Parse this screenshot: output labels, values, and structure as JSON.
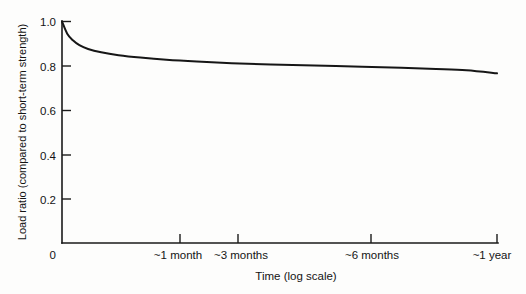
{
  "chart_data": {
    "type": "line",
    "title": "",
    "xlabel": "Time (log scale)",
    "ylabel": "Load ratio (compared to short-term strength)",
    "grid": false,
    "legend": false,
    "x_scale": "log",
    "x_tick_labels": [
      "0",
      "~1 month",
      "~3 months",
      "~6 months",
      "~1 year"
    ],
    "y_tick_labels": [
      "0",
      "0.2",
      "0.4",
      "0.6",
      "0.8",
      "1.0"
    ],
    "y_tick_values": [
      0,
      0.2,
      0.4,
      0.6,
      0.8,
      1.0
    ],
    "ylim": [
      0,
      1.0
    ],
    "series": [
      {
        "name": "Load duration factor",
        "x_labels": [
          "0",
          "~1 month",
          "~3 months",
          "~6 months",
          "~1 year"
        ],
        "points": [
          {
            "x": 0.0,
            "y": 1.0
          },
          {
            "x": 0.012,
            "y": 0.945
          },
          {
            "x": 0.025,
            "y": 0.915
          },
          {
            "x": 0.04,
            "y": 0.893
          },
          {
            "x": 0.06,
            "y": 0.876
          },
          {
            "x": 0.09,
            "y": 0.861
          },
          {
            "x": 0.13,
            "y": 0.848
          },
          {
            "x": 0.18,
            "y": 0.837
          },
          {
            "x": 0.24,
            "y": 0.827
          },
          {
            "x": 0.31,
            "y": 0.819
          },
          {
            "x": 0.39,
            "y": 0.812
          },
          {
            "x": 0.48,
            "y": 0.806
          },
          {
            "x": 0.58,
            "y": 0.801
          },
          {
            "x": 0.69,
            "y": 0.796
          },
          {
            "x": 0.78,
            "y": 0.791
          },
          {
            "x": 0.86,
            "y": 0.786
          },
          {
            "x": 0.93,
            "y": 0.78
          },
          {
            "x": 1.0,
            "y": 0.766
          }
        ]
      }
    ],
    "annotations": []
  },
  "axes": {
    "y_axis_name": "load-ratio-axis",
    "x_axis_name": "time-axis"
  }
}
